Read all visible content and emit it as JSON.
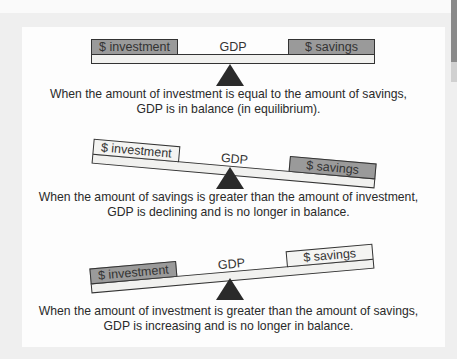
{
  "diagram": {
    "type": "balance-scale-illustration",
    "scales": [
      {
        "state": "balanced",
        "tilt_deg": 0,
        "left_box": {
          "label": "$ investment",
          "shade": "dark"
        },
        "center_label": "GDP",
        "right_box": {
          "label": "$ savings",
          "shade": "dark"
        },
        "caption_line1": "When the amount of investment is equal to the amount of savings,",
        "caption_line2": "GDP is in balance (in equilibrium)."
      },
      {
        "state": "savings-heavier",
        "tilt_deg": 5,
        "left_box": {
          "label": "$ investment",
          "shade": "light"
        },
        "center_label": "GDP",
        "right_box": {
          "label": "$ savings",
          "shade": "dark"
        },
        "caption_line1": "When the amount of savings is greater than the amount of investment,",
        "caption_line2": "GDP is declining and is no longer in balance."
      },
      {
        "state": "investment-heavier",
        "tilt_deg": -5,
        "left_box": {
          "label": "$ investment",
          "shade": "dark"
        },
        "center_label": "GDP",
        "right_box": {
          "label": "$ savings",
          "shade": "light"
        },
        "caption_line1": "When the amount of investment is greater than the amount of savings,",
        "caption_line2": "GDP is increasing and is no longer in balance."
      }
    ]
  },
  "colors": {
    "background": "#efefef",
    "panel": "#fdfdfd",
    "dark_box": "#9a9a9a",
    "light_box": "#f4f4f2",
    "fulcrum": "#2a2a2a",
    "text": "#2a2a2a"
  }
}
